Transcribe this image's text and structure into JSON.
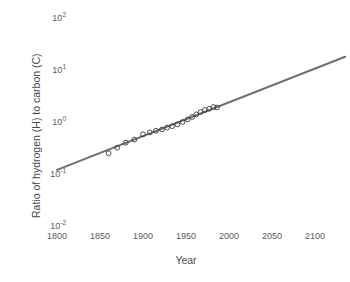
{
  "chart_data": {
    "type": "scatter",
    "title": "",
    "xlabel": "Year",
    "ylabel": "Ratio of hydrogen (H) to carbon (C)",
    "xscale": "linear",
    "yscale": "log",
    "xlim": [
      1800,
      2140
    ],
    "ylim": [
      0.01,
      100
    ],
    "grid": false,
    "legend": null,
    "xticks": [
      "1800",
      "1850",
      "1900",
      "1950",
      "2000",
      "2050",
      "2100"
    ],
    "xtick_values": [
      1800,
      1850,
      1900,
      1950,
      2000,
      2050,
      2100
    ],
    "yticks": [
      "10-2",
      "10-1",
      "100",
      "101",
      "102"
    ],
    "ytick_bases": [
      "10",
      "10",
      "10",
      "10",
      "10"
    ],
    "ytick_exponents": [
      "-2",
      "-1",
      "0",
      "1",
      "2"
    ],
    "ytick_values": [
      0.01,
      0.1,
      1,
      10,
      100
    ],
    "series": [
      {
        "name": "Observed H:C ratio",
        "marker": "open-circle",
        "marker_color": "#3c3c3c",
        "x": [
          1860,
          1870,
          1880,
          1890,
          1900,
          1908,
          1915,
          1922,
          1928,
          1934,
          1940,
          1946,
          1952,
          1957,
          1962,
          1967,
          1972,
          1977,
          1982,
          1986
        ],
        "y": [
          0.25,
          0.32,
          0.4,
          0.46,
          0.58,
          0.63,
          0.68,
          0.72,
          0.78,
          0.83,
          0.9,
          1.0,
          1.12,
          1.25,
          1.4,
          1.55,
          1.7,
          1.8,
          1.95,
          1.9
        ]
      }
    ],
    "trendline": {
      "name": "Exponential fit",
      "color": "#6e6e6e",
      "x": [
        1800,
        2135
      ],
      "y": [
        0.12,
        18.0
      ]
    },
    "annotations": []
  },
  "axis": {
    "x_title": "Year",
    "y_title": "Ratio of hydrogen (H) to carbon (C)"
  },
  "colors": {
    "trendline": "#6e6e6e",
    "marker_stroke": "#3c3c3c",
    "tick_text": "#5a5a5a",
    "title_text": "#4a4a4a",
    "background": "#ffffff"
  }
}
